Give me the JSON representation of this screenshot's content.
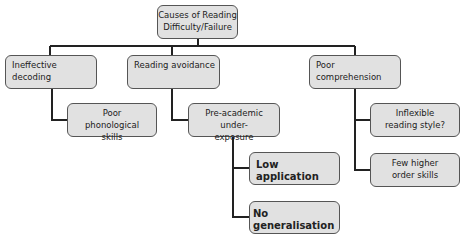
{
  "diagram": {
    "type": "tree",
    "root": {
      "label": "Causes of Reading Difficulty/Failure"
    },
    "level1": [
      {
        "label": "Ineffective decoding",
        "children": [
          {
            "label": "Poor phonological skills"
          }
        ]
      },
      {
        "label": "Reading avoidance",
        "children": [
          {
            "label": "Pre-academic under-exposure",
            "children": [
              {
                "label": "Low application"
              },
              {
                "label": "No generalisation"
              }
            ]
          }
        ]
      },
      {
        "label": "Poor comprehension",
        "children": [
          {
            "label": "Inflexible reading style?"
          },
          {
            "label": "Few higher order skills"
          }
        ]
      }
    ]
  },
  "colors": {
    "node_fill": "#e1e1e1",
    "node_border": "#555555",
    "connector": "#222222"
  }
}
